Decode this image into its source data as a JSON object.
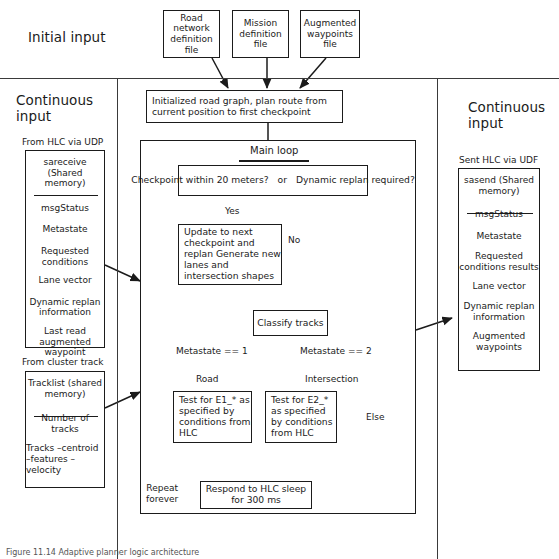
{
  "figure": {
    "domain": "diagram",
    "caption": "Figure 11.14 Adaptive planner logic architecture"
  },
  "sections": {
    "initial_input_label": "Initial input",
    "continuous_input_left_label": "Continuous\ninput",
    "continuous_input_right_label": "Continuous\ninput"
  },
  "initial_inputs": [
    {
      "id": "road-network-definition-file",
      "text": "Road\nnetwork\ndefinition\nfile"
    },
    {
      "id": "mission-definition-file",
      "text": "Mission\ndefinition\nfile"
    },
    {
      "id": "augmented-waypoints-file",
      "text": "Augmented\nwaypoints\nfile"
    }
  ],
  "left_panel": {
    "udp_header": "From HLC via UDP",
    "udp_box": {
      "title": "sareceive\n(Shared\nmemory)",
      "items": [
        "msgStatus",
        "Metastate",
        "Requested\nconditions",
        "Lane vector",
        "Dynamic replan\ninformation",
        "Last read\naugmented\nwaypoint"
      ]
    },
    "cluster_header": "From cluster track",
    "cluster_box": {
      "title": "Tracklist\n(shared\nmemory)",
      "items": [
        "Number of\ntracks",
        "Tracks\n–centroid\n–features\n–velocity"
      ]
    }
  },
  "right_panel": {
    "udf_header": "Sent HLC via UDF",
    "udf_box": {
      "title": "sasend\n(Shared\nmemory)",
      "items": [
        "msgStatus",
        "Metastate",
        "Requested\nconditions\nresults",
        "Lane vector",
        "Dynamic replan\ninformation",
        "Augmented\nwaypoints"
      ]
    }
  },
  "flow": {
    "init_node": "Initialized road graph, plan route\nfrom current position to first checkpoint",
    "main_loop_label": "Main loop",
    "decision": {
      "left": "Checkpoint within\n20 meters?",
      "connector": "or",
      "right": "Dynamic replan\nrequired?"
    },
    "update_node": "Update to next\ncheckpoint and replan\nGenerate new lanes\nand intersection\nshapes",
    "classify_node": "Classify tracks",
    "test_e1_node": "Test for E1_*\nas specified by\nconditions from\nHLC",
    "test_e2_node": "Test for E2_*\nas specified by\nconditions from\nHLC",
    "respond_node": "Respond to HLC\nsleep for 300 ms"
  },
  "edge_labels": {
    "yes": "Yes",
    "no": "No",
    "metastate_1": "Metastate == 1",
    "metastate_2": "Metastate == 2",
    "road": "Road",
    "intersection": "Intersection",
    "else": "Else",
    "repeat_forever": "Repeat\nforever"
  },
  "colors": {
    "stroke": "#1b1b1b",
    "background": "#ffffff",
    "rule": "#3a3a3a"
  }
}
